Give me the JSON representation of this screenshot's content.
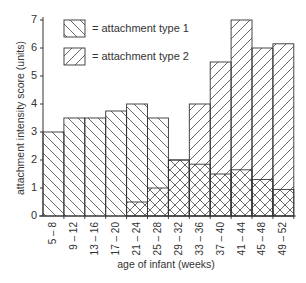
{
  "chart_data": {
    "type": "bar",
    "title": "",
    "xlabel": "age of infant (weeks)",
    "ylabel": "attachment intensity score (units)",
    "ylim": [
      0,
      7
    ],
    "yticks": [
      "0",
      "1",
      "2",
      "3",
      "4",
      "5",
      "6",
      "7"
    ],
    "grid": false,
    "legend_position": "upper-left (inside)",
    "categories": [
      "5 – 8",
      "9 – 12",
      "13 – 16",
      "17 – 20",
      "21 – 24",
      "25 – 28",
      "29 – 32",
      "33 – 36",
      "37 – 40",
      "41 – 44",
      "45 – 48",
      "49 – 52"
    ],
    "series": [
      {
        "name": "attachment type 1",
        "hatch": "backslash",
        "values": [
          3.0,
          3.5,
          3.5,
          3.75,
          4.0,
          3.5,
          2.0,
          1.85,
          1.5,
          1.65,
          1.3,
          0.95
        ]
      },
      {
        "name": "attachment type 2",
        "hatch": "slash",
        "values": [
          0,
          0,
          0,
          0,
          0.5,
          1.0,
          2.0,
          4.0,
          5.5,
          7.0,
          6.0,
          6.15
        ]
      }
    ],
    "overlay": "series overlaid (not stacked); overlap region cross-hatched"
  },
  "legend": {
    "items": [
      {
        "label": "= attachment type 1"
      },
      {
        "label": "= attachment type 2"
      }
    ]
  },
  "colors": {
    "line": "#333333",
    "hatch": "#444444",
    "background": "#ffffff"
  }
}
